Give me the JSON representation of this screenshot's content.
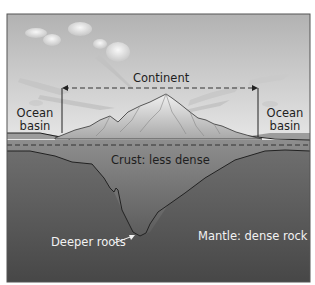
{
  "diagram": {
    "labels": {
      "continent": "Continent",
      "ocean_basin_left_line1": "Ocean",
      "ocean_basin_left_line2": "basin",
      "ocean_basin_right_line1": "Ocean",
      "ocean_basin_right_line2": "basin",
      "crust": "Crust: less dense",
      "deeper_roots": "Deeper roots",
      "mantle": "Mantle: dense rock"
    },
    "colors": {
      "sky_top": "#b4b4b4",
      "sky_bottom": "#e4e4e4",
      "crust_top": "#8c8c8c",
      "crust_bottom": "#5a5a5a",
      "mantle_top": "#6e6e6e",
      "mantle_bottom": "#4a4a4a",
      "mountain": "#dcdcdc",
      "line": "#222222",
      "frame": "#555555"
    }
  }
}
